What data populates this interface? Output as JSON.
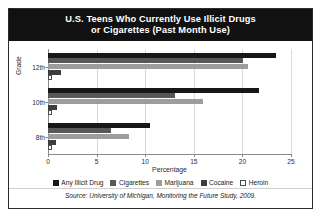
{
  "title": "U.S. Teens Who Currently Use Illicit Drugs or Cigarettes (Past Month Use)",
  "title_line1": "U.S. Teens Who Currently Use Illicit Drugs",
  "title_line2": "or Cigarettes (Past Month Use)",
  "source": "Source: University of Michigan, Monitoring the Future Study, 2009.",
  "axis": {
    "xlabel": "Percentage",
    "ylabel": "Grade",
    "xticks": [
      "0",
      "5",
      "10",
      "15",
      "20",
      "25"
    ],
    "ycategories": [
      "12th",
      "10th",
      "8th"
    ]
  },
  "legend": {
    "items": [
      {
        "label": "Any Illicit Drug",
        "color": "#171717"
      },
      {
        "label": "Cigarettes",
        "color": "#585858"
      },
      {
        "label": "Marijuana",
        "color": "#9d9d9d"
      },
      {
        "label": "Cocaine",
        "color": "#3d3d3d"
      },
      {
        "label": "Heroin",
        "color": "#ffffff"
      }
    ]
  },
  "chart_data": {
    "type": "bar",
    "orientation": "horizontal",
    "title": "U.S. Teens Who Currently Use Illicit Drugs or Cigarettes (Past Month Use)",
    "xlabel": "Percentage",
    "ylabel": "Grade",
    "xlim": [
      0,
      25
    ],
    "xticks": [
      0,
      5,
      10,
      15,
      20,
      25
    ],
    "grid": true,
    "legend_position": "bottom",
    "categories": [
      "12th",
      "10th",
      "8th"
    ],
    "series": [
      {
        "name": "Any Illicit Drug",
        "color": "#171717",
        "values": [
          23.5,
          21.7,
          10.5
        ]
      },
      {
        "name": "Cigarettes",
        "color": "#585858",
        "values": [
          20.1,
          13.1,
          6.5
        ]
      },
      {
        "name": "Marijuana",
        "color": "#9d9d9d",
        "values": [
          20.6,
          15.9,
          8.3
        ]
      },
      {
        "name": "Cocaine",
        "color": "#3d3d3d",
        "values": [
          1.3,
          0.9,
          0.8
        ]
      },
      {
        "name": "Heroin",
        "color": "#ffffff",
        "values": [
          0.4,
          0.4,
          0.4
        ]
      }
    ],
    "annotations": [
      "Source: University of Michigan, Monitoring the Future Study, 2009."
    ]
  }
}
